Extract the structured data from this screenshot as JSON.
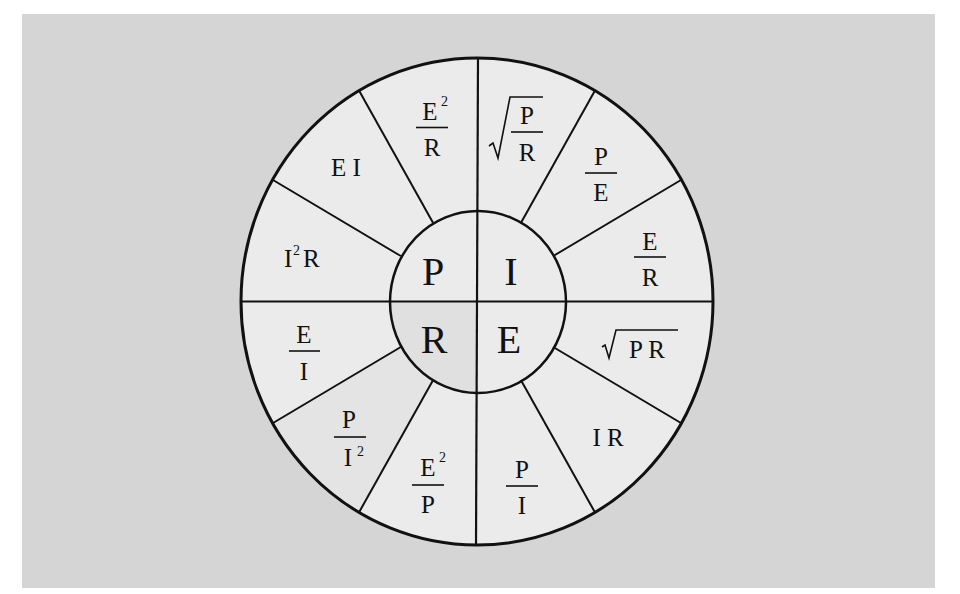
{
  "diagram": {
    "colors": {
      "background": "#d5d5d5",
      "wheel_fill": "#ebebeb",
      "r_quadrant_fill": "#e0e0e0",
      "p_over_i2_fill": "#e4e4e4",
      "stroke": "#111111"
    },
    "center": {
      "P": "P",
      "I": "I",
      "R": "R",
      "E": "E"
    },
    "wedges": {
      "P_quadrant": [
        {
          "id": "I2R",
          "type": "power",
          "base": "I",
          "exp": "2",
          "rest": "R"
        },
        {
          "id": "EI",
          "type": "text",
          "text": "E I"
        },
        {
          "id": "E2_over_R",
          "type": "frac",
          "num": "E",
          "num_exp": "2",
          "den": "R"
        }
      ],
      "I_quadrant": [
        {
          "id": "sqrt_P_over_R",
          "type": "sqrt-frac",
          "num": "P",
          "den": "R"
        },
        {
          "id": "P_over_E",
          "type": "frac",
          "num": "P",
          "den": "E"
        },
        {
          "id": "E_over_R",
          "type": "frac",
          "num": "E",
          "den": "R"
        }
      ],
      "E_quadrant": [
        {
          "id": "sqrt_PR",
          "type": "sqrt",
          "text": "P R"
        },
        {
          "id": "IR",
          "type": "text",
          "text": "I R"
        },
        {
          "id": "P_over_I",
          "type": "frac",
          "num": "P",
          "den": "I"
        }
      ],
      "R_quadrant": [
        {
          "id": "E2_over_P",
          "type": "frac",
          "num": "E",
          "num_exp": "2",
          "den": "P"
        },
        {
          "id": "P_over_I2",
          "type": "frac",
          "num": "P",
          "den": "I",
          "den_exp": "2"
        },
        {
          "id": "E_over_I",
          "type": "frac",
          "num": "E",
          "den": "I"
        }
      ]
    },
    "labels": {
      "EI": "E I",
      "IR": "I R",
      "I2R_base": "I",
      "I2R_exp": "2",
      "I2R_rest": "R",
      "E2R_num": "E",
      "E2R_exp": "2",
      "E2R_den": "R",
      "PR_num": "P",
      "PR_den": "R",
      "PE_num": "P",
      "PE_den": "E",
      "ER_num": "E",
      "ER_den": "R",
      "sqrtPR": "P R",
      "PI_num": "P",
      "PI_den": "I",
      "E2P_num": "E",
      "E2P_exp": "2",
      "E2P_den": "P",
      "PI2_num": "P",
      "PI2_den": "I",
      "PI2_exp": "2",
      "EI_num": "E",
      "EI_den": "I"
    }
  }
}
